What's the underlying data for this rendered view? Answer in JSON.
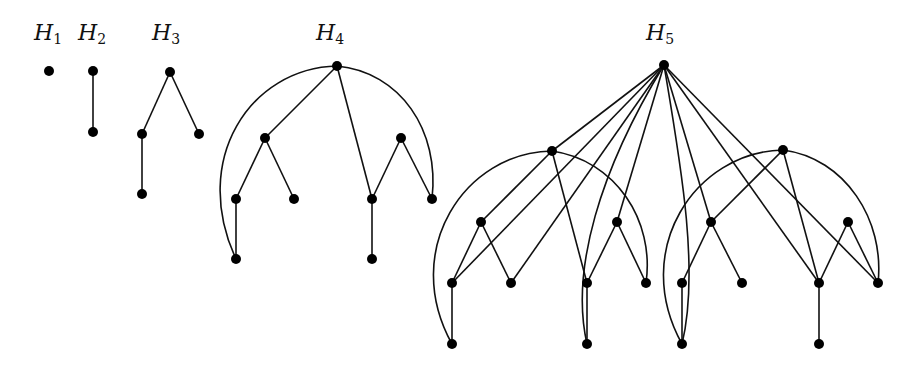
{
  "figure": {
    "stroke_color": "#111111",
    "node_color": "#000000",
    "node_radius": 5
  },
  "graphs": [
    {
      "id": "H1",
      "label": {
        "base": "H",
        "sub": "1",
        "x": 48,
        "y": 22
      },
      "nodes": [
        {
          "id": "r",
          "x": 49,
          "y": 71
        }
      ],
      "edges": [],
      "arcs": []
    },
    {
      "id": "H2",
      "label": {
        "base": "H",
        "sub": "2",
        "x": 92,
        "y": 22
      },
      "nodes": [
        {
          "id": "r",
          "x": 93,
          "y": 71
        },
        {
          "id": "a",
          "x": 93,
          "y": 132
        }
      ],
      "edges": [
        [
          "r",
          "a"
        ]
      ],
      "arcs": []
    },
    {
      "id": "H3",
      "label": {
        "base": "H",
        "sub": "3",
        "x": 166,
        "y": 22
      },
      "nodes": [
        {
          "id": "r",
          "x": 170,
          "y": 72
        },
        {
          "id": "a",
          "x": 142,
          "y": 134
        },
        {
          "id": "b",
          "x": 199,
          "y": 134
        },
        {
          "id": "c",
          "x": 142,
          "y": 194
        }
      ],
      "edges": [
        [
          "r",
          "a"
        ],
        [
          "r",
          "b"
        ],
        [
          "a",
          "c"
        ]
      ],
      "arcs": []
    },
    {
      "id": "H4",
      "label": {
        "base": "H",
        "sub": "4",
        "x": 330,
        "y": 22
      },
      "nodes": [
        {
          "id": "r",
          "x": 337,
          "y": 66
        },
        {
          "id": "a",
          "x": 265,
          "y": 138
        },
        {
          "id": "al",
          "x": 236,
          "y": 199
        },
        {
          "id": "alb",
          "x": 236,
          "y": 259
        },
        {
          "id": "ar",
          "x": 294,
          "y": 199
        },
        {
          "id": "b",
          "x": 372,
          "y": 199
        },
        {
          "id": "bb",
          "x": 372,
          "y": 259
        },
        {
          "id": "bp",
          "x": 401,
          "y": 138
        },
        {
          "id": "br",
          "x": 432,
          "y": 199
        }
      ],
      "edges": [
        [
          "r",
          "a"
        ],
        [
          "a",
          "al"
        ],
        [
          "a",
          "ar"
        ],
        [
          "al",
          "alb"
        ],
        [
          "r",
          "b"
        ],
        [
          "b",
          "bb"
        ],
        [
          "b",
          "bp"
        ],
        [
          "bp",
          "br"
        ]
      ],
      "arcs": [
        {
          "d": "M337,66 C250,68 190,160 236,259"
        },
        {
          "d": "M337,66 C400,72 440,130 432,199"
        }
      ]
    },
    {
      "id": "H5",
      "label": {
        "base": "H",
        "sub": "5",
        "x": 660,
        "y": 22
      },
      "nodes": [
        {
          "id": "R",
          "x": 664,
          "y": 65
        },
        {
          "id": "Lr",
          "x": 552,
          "y": 151
        },
        {
          "id": "La",
          "x": 481,
          "y": 222
        },
        {
          "id": "Lal",
          "x": 452,
          "y": 283
        },
        {
          "id": "Lalb",
          "x": 452,
          "y": 344
        },
        {
          "id": "Lar",
          "x": 511,
          "y": 283
        },
        {
          "id": "Lb",
          "x": 587,
          "y": 283
        },
        {
          "id": "Lbb",
          "x": 587,
          "y": 344
        },
        {
          "id": "Lbp",
          "x": 617,
          "y": 222
        },
        {
          "id": "Lbr",
          "x": 646,
          "y": 283
        },
        {
          "id": "Rr",
          "x": 783,
          "y": 150
        },
        {
          "id": "Ra",
          "x": 711,
          "y": 222
        },
        {
          "id": "Ral",
          "x": 682,
          "y": 283
        },
        {
          "id": "Ralb",
          "x": 682,
          "y": 344
        },
        {
          "id": "Rar",
          "x": 742,
          "y": 283
        },
        {
          "id": "Rb",
          "x": 819,
          "y": 283
        },
        {
          "id": "Rbb",
          "x": 819,
          "y": 344
        },
        {
          "id": "Rbp",
          "x": 848,
          "y": 222
        },
        {
          "id": "Rbr",
          "x": 878,
          "y": 283
        }
      ],
      "edges": [
        [
          "Lr",
          "La"
        ],
        [
          "La",
          "Lal"
        ],
        [
          "La",
          "Lar"
        ],
        [
          "Lal",
          "Lalb"
        ],
        [
          "Lr",
          "Lb"
        ],
        [
          "Lb",
          "Lbb"
        ],
        [
          "Lb",
          "Lbp"
        ],
        [
          "Lbp",
          "Lbr"
        ],
        [
          "Rr",
          "Ra"
        ],
        [
          "Ra",
          "Ral"
        ],
        [
          "Ra",
          "Rar"
        ],
        [
          "Ral",
          "Ralb"
        ],
        [
          "Rr",
          "Rb"
        ],
        [
          "Rb",
          "Rbb"
        ],
        [
          "Rb",
          "Rbp"
        ],
        [
          "Rbp",
          "Rbr"
        ],
        [
          "R",
          "Lr"
        ],
        [
          "R",
          "Lal"
        ],
        [
          "R",
          "Lar"
        ],
        [
          "R",
          "Lbp"
        ],
        [
          "R",
          "Ra"
        ],
        [
          "R",
          "Rb"
        ],
        [
          "R",
          "Rbr"
        ]
      ],
      "arcs": [
        {
          "d": "M552,151 C465,152 400,250 452,344"
        },
        {
          "d": "M552,151 C615,160 655,220 646,283"
        },
        {
          "d": "M783,150 C695,152 630,250 682,344"
        },
        {
          "d": "M783,150 C845,158 885,220 878,283"
        },
        {
          "d": "M664,65 C600,170 570,270 587,344"
        },
        {
          "d": "M664,65 C680,160 700,270 682,344"
        }
      ]
    }
  ]
}
